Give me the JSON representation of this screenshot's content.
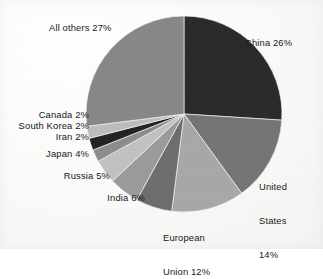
{
  "figure": {
    "background_color": "#f7f7f5",
    "label_color": "#17171a"
  },
  "chart_data": {
    "type": "pie",
    "title": "",
    "subtitle": "",
    "xlabel": "",
    "ylabel": "",
    "legend_position": "none",
    "grid": false,
    "total_percent": 100,
    "start_angle_deg": 0,
    "direction": "clockwise",
    "categories": [
      "China",
      "United States",
      "European Union",
      "India",
      "Russia",
      "Japan",
      "Iran",
      "South Korea",
      "Canada",
      "All others"
    ],
    "values": [
      26,
      14,
      12,
      6,
      5,
      4,
      2,
      2,
      2,
      27
    ],
    "colors": [
      "#2b2b2e",
      "#757577",
      "#a8a8a8",
      "#6e6e70",
      "#9b9b9c",
      "#c2c2c1",
      "#8d8d8e",
      "#232326",
      "#bdbdbc",
      "#888889"
    ],
    "slices": [
      {
        "name": "China",
        "value": 26,
        "label": "China 26%",
        "color": "#2b2b2e"
      },
      {
        "name": "United States",
        "value": 14,
        "label": "United States 14%",
        "color": "#757577"
      },
      {
        "name": "European Union",
        "value": 12,
        "label": "European Union 12%",
        "color": "#a8a8a8"
      },
      {
        "name": "India",
        "value": 6,
        "label": "India 6%",
        "color": "#6e6e70"
      },
      {
        "name": "Russia",
        "value": 5,
        "label": "Russia 5%",
        "color": "#9b9b9c"
      },
      {
        "name": "Japan",
        "value": 4,
        "label": "Japan 4%",
        "color": "#c2c2c1"
      },
      {
        "name": "Iran",
        "value": 2,
        "label": "Iran 2%",
        "color": "#8d8d8e"
      },
      {
        "name": "South Korea",
        "value": 2,
        "label": "South Korea 2%",
        "color": "#232326"
      },
      {
        "name": "Canada",
        "value": 2,
        "label": "Canada 2%",
        "color": "#bdbdbc"
      },
      {
        "name": "All others",
        "value": 27,
        "label": "All others 27%",
        "color": "#888889"
      }
    ],
    "labels": {
      "china": "China 26%",
      "united_states_line1": "United",
      "united_states_line2": "States",
      "united_states_line3": "14%",
      "european_union_line1": "European",
      "european_union_line2": "Union 12%",
      "india": "India 6%",
      "russia": "Russia 5%",
      "japan": "Japan 4%",
      "iran": "Iran 2%",
      "south_korea": "South Korea 2%",
      "canada": "Canada 2%",
      "all_others": "All others 27%"
    }
  }
}
